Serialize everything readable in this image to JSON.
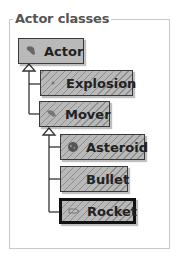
{
  "frame": {
    "title": "Actor classes"
  },
  "classes": [
    {
      "name": "Actor",
      "icon": "actor-icon",
      "hatched": false,
      "selected": false
    },
    {
      "name": "Explosion",
      "icon": "explosion-icon",
      "hatched": true,
      "selected": false
    },
    {
      "name": "Mover",
      "icon": "mover-icon",
      "hatched": true,
      "selected": false
    },
    {
      "name": "Asteroid",
      "icon": "asteroid-icon",
      "hatched": true,
      "selected": false
    },
    {
      "name": "Bullet",
      "icon": "bullet-icon",
      "hatched": true,
      "selected": false
    },
    {
      "name": "Rocket",
      "icon": "rocket-icon",
      "hatched": true,
      "selected": true
    }
  ],
  "hierarchy": [
    {
      "parent": "Actor",
      "children": [
        "Explosion",
        "Mover"
      ]
    },
    {
      "parent": "Mover",
      "children": [
        "Asteroid",
        "Bullet",
        "Rocket"
      ]
    }
  ],
  "colors": {
    "box_fill": "#b9b9b9",
    "hatch": "#8e8e8e",
    "border": "#3a3a3a",
    "frame": "#c8c8c8"
  }
}
